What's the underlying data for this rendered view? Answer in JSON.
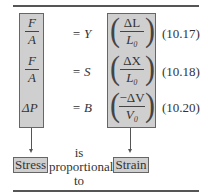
{
  "equations": [
    {
      "lhs_num": "F",
      "lhs_den": "A",
      "rhs": "= Y",
      "strain_num": "ΔL",
      "strain_den": "L₀",
      "number": "(10.17)"
    },
    {
      "lhs_num": "F",
      "lhs_den": "A",
      "rhs": "= S",
      "strain_num": "ΔX",
      "strain_den": "L₀",
      "number": "(10.18)"
    },
    {
      "lhs": "ΔP",
      "rhs": "= B",
      "strain_num": "−ΔV",
      "strain_den": "V₀",
      "number": "(10.20)"
    }
  ],
  "labels": {
    "stress": "Stress",
    "strain": "Strain",
    "is": "is",
    "proportional": "proportional",
    "to": "to"
  }
}
